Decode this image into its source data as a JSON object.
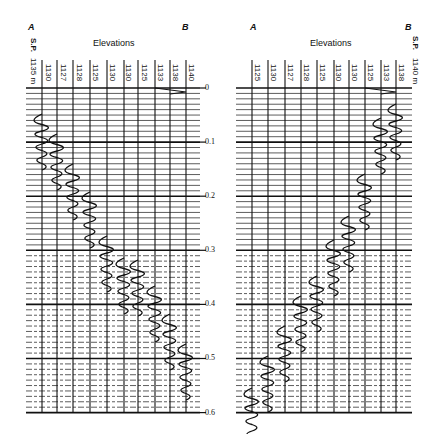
{
  "left_panel": {
    "label_a": "A",
    "label_b": "B",
    "shotpoint_label": "S.P.",
    "first_elevation": "1135 m",
    "title": "Elevations",
    "elevations": [
      "1130",
      "1127",
      "1128",
      "1125",
      "1130",
      "1130",
      "1125",
      "1133",
      "1138",
      "1140"
    ]
  },
  "right_panel": {
    "label_a": "A",
    "label_b": "B",
    "shotpoint_label": "S.P.",
    "last_elevation": "1140 m",
    "title": "Elevations",
    "elevations": [
      "1125",
      "1130",
      "1127",
      "1128",
      "1125",
      "1130",
      "1130",
      "1125",
      "1133",
      "1138"
    ]
  },
  "time_axis": {
    "ticks": [
      "0",
      "0.1",
      "0.2",
      "0.3",
      "0.4",
      "0.5",
      "0.6"
    ]
  }
}
